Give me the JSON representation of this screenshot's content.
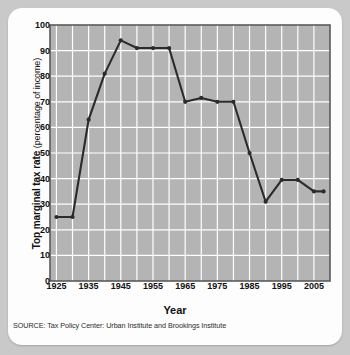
{
  "figure": {
    "source_note": "SOURCE: Tax Policy Center: Urban Institute and Brookings Institute",
    "y_axis_title_main": "Top marginal tax rate",
    "y_axis_title_sub": "(percentage of income)",
    "x_axis_title": "Year"
  },
  "chart_data": {
    "type": "line",
    "title": "",
    "xlabel": "Year",
    "ylabel": "Top marginal tax rate (percentage of income)",
    "xlim": [
      1923,
      2010
    ],
    "ylim": [
      0,
      100
    ],
    "grid": true,
    "legend": "none",
    "y_ticks": [
      0,
      10,
      20,
      30,
      40,
      50,
      60,
      70,
      80,
      90,
      100
    ],
    "y_tick_labels": [
      "0",
      "10",
      "20",
      "30",
      "40",
      "50",
      "60",
      "70",
      "80",
      "90",
      "100"
    ],
    "x_ticks": [
      1925,
      1935,
      1945,
      1955,
      1965,
      1975,
      1985,
      1995,
      2005
    ],
    "x_tick_labels": [
      "1925",
      "1935",
      "1945",
      "1955",
      "1965",
      "1975",
      "1985",
      "1995",
      "2005"
    ],
    "x_minor_gridline_step": 5,
    "marker": "circle",
    "series": [
      {
        "name": "Top marginal tax rate",
        "color": "#2b2b2b",
        "x": [
          1925,
          1930,
          1935,
          1940,
          1945,
          1950,
          1955,
          1960,
          1965,
          1970,
          1975,
          1980,
          1985,
          1990,
          1995,
          2000,
          2005,
          2008
        ],
        "values": [
          25,
          25,
          63,
          81,
          94,
          91,
          91,
          91,
          70,
          71.5,
          70,
          70,
          50,
          31,
          39.5,
          39.5,
          35,
          35
        ]
      }
    ]
  },
  "style": {
    "plot_background": "#b4b4b4",
    "gridline_color": "#ffffff",
    "frame_color": "#5a5a5a",
    "line_color": "#2b2b2b",
    "card_background": "#fdfdfd",
    "page_background": "#c9c9c9"
  }
}
